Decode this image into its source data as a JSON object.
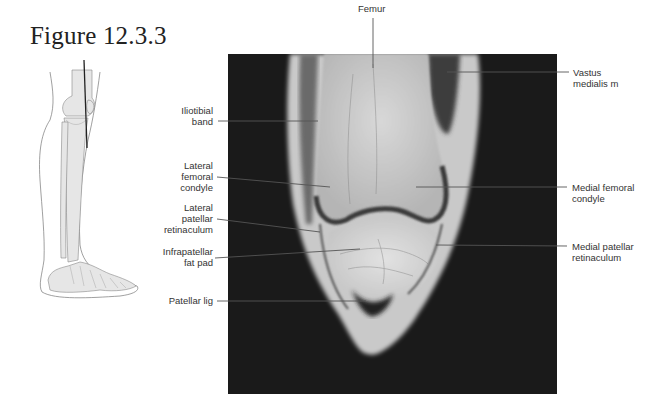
{
  "figure": {
    "title": "Figure 12.3.3"
  },
  "labels": {
    "femur": "Femur",
    "vastus_medialis": "Vastus\nmedialis m",
    "iliotibial_band": "Iliotibial\nband",
    "lateral_femoral_condyle": "Lateral\nfemoral\ncondyle",
    "lateral_patellar_retinaculum": "Lateral\npatellar\nretinaculum",
    "infrapatellar_fat_pad": "Infrapatellar\nfat pad",
    "patellar_lig": "Patellar lig",
    "medial_femoral_condyle": "Medial femoral\ncondyle",
    "medial_patellar_retinaculum": "Medial patellar\nretinaculum"
  },
  "colors": {
    "mri_background": "#1a1a1a",
    "leader_line": "#555555",
    "text": "#333333"
  }
}
